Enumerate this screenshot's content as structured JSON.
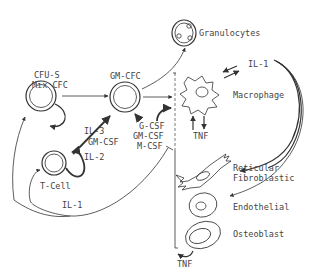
{
  "colors": {
    "ink": "#333333",
    "text": "#444444",
    "background": "#ffffff"
  },
  "cells": {
    "cfu_s": {
      "line1": "CFU-S",
      "line2": "Mix CFC"
    },
    "gm_cfc": {
      "label": "GM-CFC"
    },
    "granulocytes": {
      "label": "Granulocytes"
    },
    "t_cell": {
      "label": "T-Cell"
    },
    "macrophage": {
      "label": "Macrophage"
    },
    "reticular": {
      "line1": "Reticular",
      "line2": "Fibroblastic"
    },
    "endothelial": {
      "label": "Endothelial"
    },
    "osteoblast": {
      "label": "Osteoblast"
    }
  },
  "cytokines": {
    "il3": "IL-3",
    "gmcsf_tcell": "GM-CSF",
    "il2": "IL-2",
    "il1_bottom": "IL-1",
    "il1_top": "IL-1",
    "csf_lines": [
      "G-CSF",
      "GM-CSF",
      "M-CSF"
    ],
    "tnf_macrophage": "TNF",
    "tnf_bottom": "TNF"
  }
}
